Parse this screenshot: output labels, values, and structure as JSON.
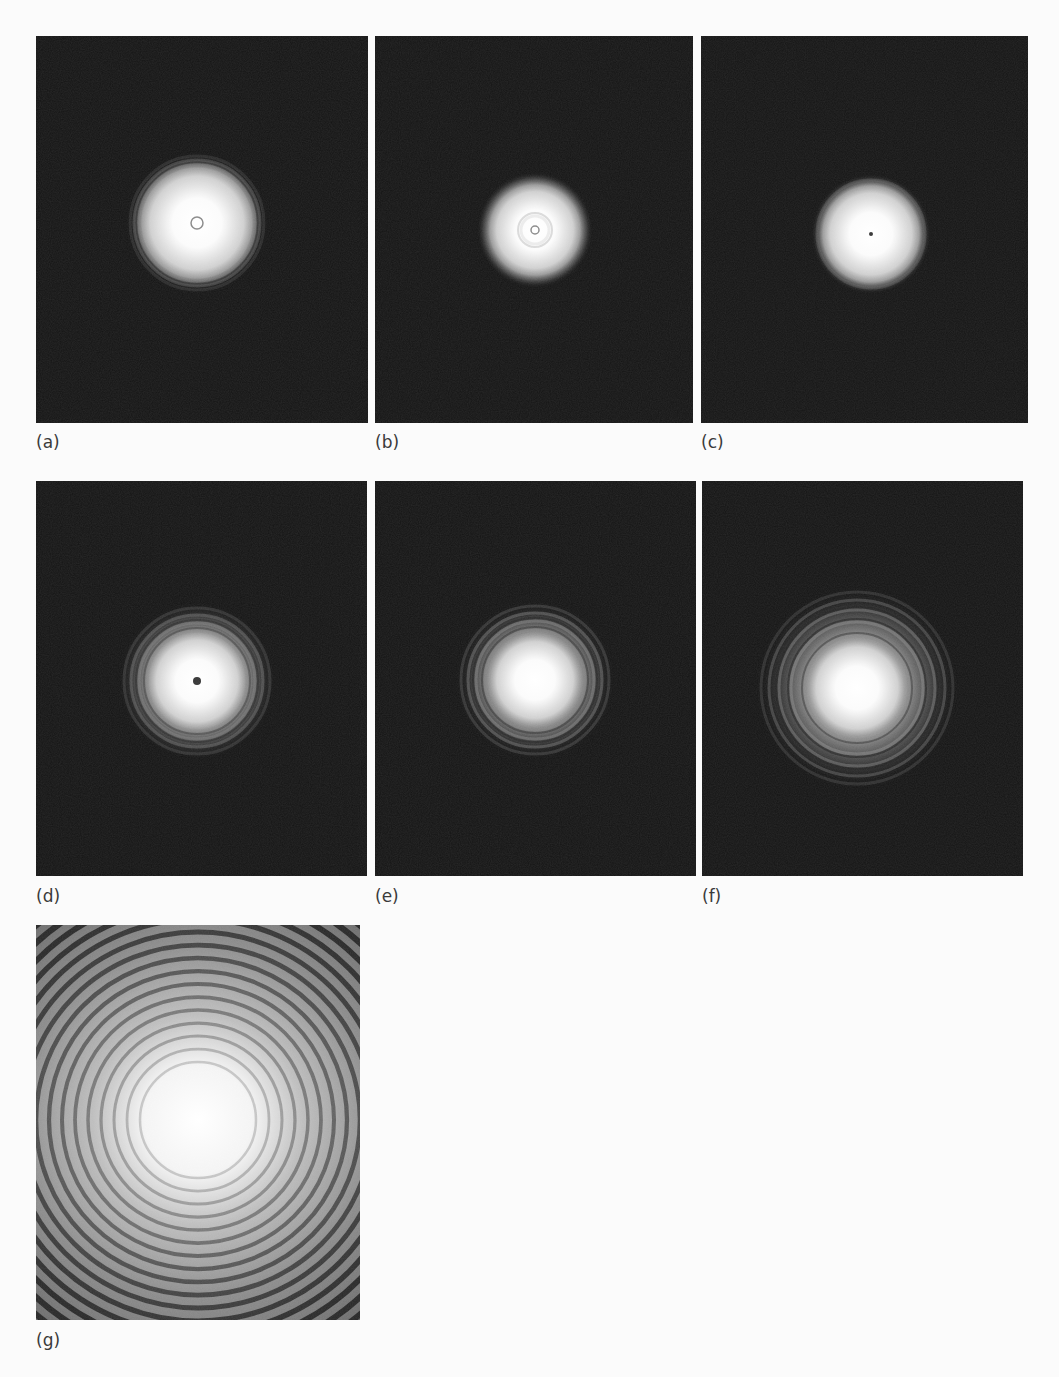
{
  "figure": {
    "panels": [
      {
        "id": "a",
        "label": "(a)",
        "box": {
          "x": 36,
          "y": 36,
          "w": 332,
          "h": 387
        },
        "label_pos": {
          "x": 36,
          "y": 432
        },
        "spot": {
          "cx": 161,
          "cy": 187,
          "core_r": 55,
          "halo_r": 68,
          "rings": [
            {
              "r": 58,
              "o": 0.35
            },
            {
              "r": 63,
              "o": 0.25
            },
            {
              "r": 67,
              "o": 0.18
            }
          ],
          "center_mark": {
            "type": "ring",
            "r": 6
          }
        }
      },
      {
        "id": "b",
        "label": "(b)",
        "box": {
          "x": 375,
          "y": 36,
          "w": 318,
          "h": 387
        },
        "label_pos": {
          "x": 375,
          "y": 432
        },
        "spot": {
          "cx": 160,
          "cy": 194,
          "core_r": 45,
          "halo_r": 58,
          "rings": [
            {
              "r": 14,
              "o": 0.15
            }
          ],
          "center_mark": {
            "type": "ring",
            "r": 4
          }
        }
      },
      {
        "id": "c",
        "label": "(c)",
        "box": {
          "x": 701,
          "y": 36,
          "w": 327,
          "h": 387
        },
        "label_pos": {
          "x": 701,
          "y": 432
        },
        "spot": {
          "cx": 170,
          "cy": 198,
          "core_r": 48,
          "halo_r": 60,
          "rings": [
            {
              "r": 54,
              "o": 0.2
            }
          ],
          "center_mark": {
            "type": "dot",
            "r": 2
          }
        }
      },
      {
        "id": "d",
        "label": "(d)",
        "box": {
          "x": 36,
          "y": 481,
          "w": 331,
          "h": 395
        },
        "label_pos": {
          "x": 36,
          "y": 886
        },
        "spot": {
          "cx": 161,
          "cy": 200,
          "core_r": 48,
          "halo_r": 78,
          "rings": [
            {
              "r": 50,
              "o": 0.35
            },
            {
              "r": 58,
              "o": 0.45
            },
            {
              "r": 66,
              "o": 0.35
            },
            {
              "r": 73,
              "o": 0.22
            }
          ],
          "center_mark": {
            "type": "dot",
            "r": 4
          }
        }
      },
      {
        "id": "e",
        "label": "(e)",
        "box": {
          "x": 375,
          "y": 481,
          "w": 321,
          "h": 395
        },
        "label_pos": {
          "x": 375,
          "y": 886
        },
        "spot": {
          "cx": 160,
          "cy": 199,
          "core_r": 45,
          "halo_r": 78,
          "rings": [
            {
              "r": 50,
              "o": 0.4
            },
            {
              "r": 59,
              "o": 0.5
            },
            {
              "r": 67,
              "o": 0.4
            },
            {
              "r": 74,
              "o": 0.25
            }
          ],
          "center_mark": null
        }
      },
      {
        "id": "f",
        "label": "(f)",
        "box": {
          "x": 702,
          "y": 481,
          "w": 321,
          "h": 395
        },
        "label_pos": {
          "x": 702,
          "y": 886
        },
        "spot": {
          "cx": 155,
          "cy": 207,
          "core_r": 48,
          "halo_r": 100,
          "rings": [
            {
              "r": 52,
              "o": 0.4
            },
            {
              "r": 66,
              "o": 0.55
            },
            {
              "r": 78,
              "o": 0.45
            },
            {
              "r": 88,
              "o": 0.35
            },
            {
              "r": 96,
              "o": 0.22
            }
          ],
          "center_mark": null
        }
      },
      {
        "id": "g",
        "label": "(g)",
        "box": {
          "x": 36,
          "y": 925,
          "w": 324,
          "h": 395
        },
        "label_pos": {
          "x": 36,
          "y": 1330
        },
        "spot": {
          "cx": 162,
          "cy": 195,
          "core_r": 60,
          "halo_r": 300,
          "ring_count": 20,
          "ring_spacing": 13,
          "ring_start": 58,
          "center_mark": null
        }
      }
    ]
  }
}
